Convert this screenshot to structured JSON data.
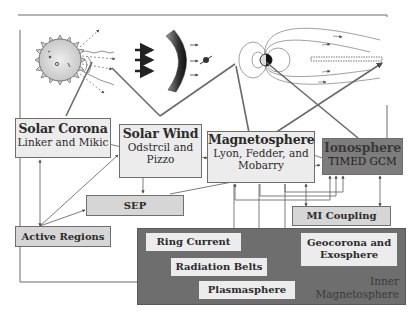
{
  "diagram": {
    "illustration": {
      "elements": [
        "sun-icon",
        "solar-wind-arrows",
        "bow-shock-arc",
        "earth-magnetosphere-field-lines",
        "magnetotail-current-sheet"
      ]
    },
    "boxes": {
      "solar_corona": {
        "title": "Solar Corona",
        "subtitle": "Linker and Mikic"
      },
      "solar_wind": {
        "title": "Solar Wind",
        "subtitle_line1": "Odstrcil and",
        "subtitle_line2": "Pizzo"
      },
      "magnetosphere": {
        "title": "Magnetosphere",
        "subtitle_line1": "Lyon, Fedder, and",
        "subtitle_line2": "Mobarry"
      },
      "ionosphere": {
        "title": "Ionosphere",
        "subtitle": "TIMED GCM"
      },
      "sep": {
        "title": "SEP"
      },
      "mi_coupling": {
        "title": "MI Coupling"
      },
      "active_regions": {
        "title": "Active Regions"
      },
      "ring_current": {
        "title": "Ring Current"
      },
      "radiation_belts": {
        "title": "Radiation Belts"
      },
      "plasmasphere": {
        "title": "Plasmasphere"
      },
      "geocorona": {
        "title_line1": "Geocorona and",
        "title_line2": "Exosphere"
      }
    },
    "region": {
      "label_line1": "Inner",
      "label_line2": "Magnetosphere"
    },
    "colors": {
      "light_box": "#ececec",
      "mid_box": "#d6d6d6",
      "dark_box": "#7d7d7d",
      "inner_region": "#6e6e6e",
      "lines": "#5a5a5a"
    }
  }
}
